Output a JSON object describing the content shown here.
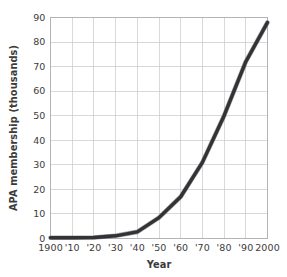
{
  "chart_data": {
    "type": "line",
    "title": "",
    "xlabel": "Year",
    "ylabel": "APA membership (thousands)",
    "x": [
      1900,
      1910,
      1920,
      1930,
      1940,
      1950,
      1960,
      1970,
      1980,
      1990,
      2000
    ],
    "xtick_labels": [
      "1900",
      "'10",
      "'20",
      "'30",
      "'40",
      "'50",
      "'60",
      "'70",
      "'80",
      "'90",
      "2000"
    ],
    "ytick_labels": [
      "0",
      "10",
      "20",
      "30",
      "40",
      "50",
      "60",
      "70",
      "80",
      "90"
    ],
    "ytick_values": [
      0,
      10,
      20,
      30,
      40,
      50,
      60,
      70,
      80,
      90
    ],
    "values": [
      0.3,
      0.3,
      0.4,
      1.1,
      2.7,
      8.5,
      17.0,
      31.0,
      50.0,
      72.0,
      88.0
    ],
    "xlim": [
      1900,
      2000
    ],
    "ylim": [
      0,
      90
    ],
    "grid": true,
    "legend": "none",
    "series": [
      {
        "name": "APA membership",
        "color": "#333336",
        "values": [
          0.3,
          0.3,
          0.4,
          1.1,
          2.7,
          8.5,
          17.0,
          31.0,
          50.0,
          72.0,
          88.0
        ]
      }
    ]
  }
}
